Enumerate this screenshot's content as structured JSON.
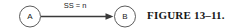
{
  "figure": {
    "caption": "FIGURE 13–11."
  },
  "diagram": {
    "type": "node-link",
    "nodes": [
      {
        "id": "A",
        "label": "A",
        "shape": "circle",
        "cx": 30,
        "cy": 16.5,
        "r": 10.5
      },
      {
        "id": "B",
        "label": "B",
        "shape": "circle",
        "cx": 125,
        "cy": 16.5,
        "r": 10.5
      }
    ],
    "edges": [
      {
        "from": "A",
        "to": "B",
        "label": "SS = n",
        "style": "solid",
        "arrowhead": "filled-triangle",
        "x1": 41,
        "x2": 114,
        "y": 16.5
      }
    ],
    "colors": {
      "stroke": "#3a3a3a",
      "text": "#1a1a1a",
      "background": "#ffffff"
    }
  }
}
